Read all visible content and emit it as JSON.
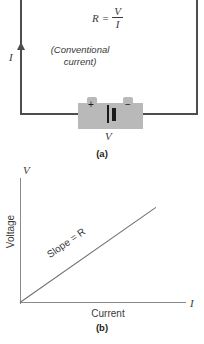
{
  "figure": {
    "panel_a": {
      "caption": "(a)",
      "formula": {
        "lhs": "R",
        "equals": "=",
        "numerator": "V",
        "denominator": "I"
      },
      "current_symbol": "I",
      "current_note_line1": "(Conventional",
      "current_note_line2": "current)",
      "battery": {
        "positive_terminal": "+",
        "negative_terminal": "−",
        "voltage_symbol": "V",
        "body_color": "#b9b9b9"
      },
      "wire_color": "#4d4d4d"
    },
    "panel_b": {
      "caption": "(b)",
      "y_axis_symbol": "V",
      "x_axis_symbol": "I",
      "y_axis_title": "Voltage",
      "x_axis_title": "Current",
      "slope_label": "Slope = R",
      "axis_color": "#8a8a8a",
      "line_color": "#6f6f6f"
    }
  },
  "chart_data": {
    "type": "line",
    "title": "",
    "xlabel": "Current",
    "ylabel": "Voltage",
    "x_axis_symbol": "I",
    "y_axis_symbol": "V",
    "annotations": [
      "Slope = R"
    ],
    "grid": false,
    "legend": null,
    "xlim": [
      0,
      1
    ],
    "ylim": [
      0,
      1
    ],
    "series": [
      {
        "name": "V = IR",
        "x": [
          0,
          1
        ],
        "values": [
          0,
          1
        ]
      }
    ]
  }
}
